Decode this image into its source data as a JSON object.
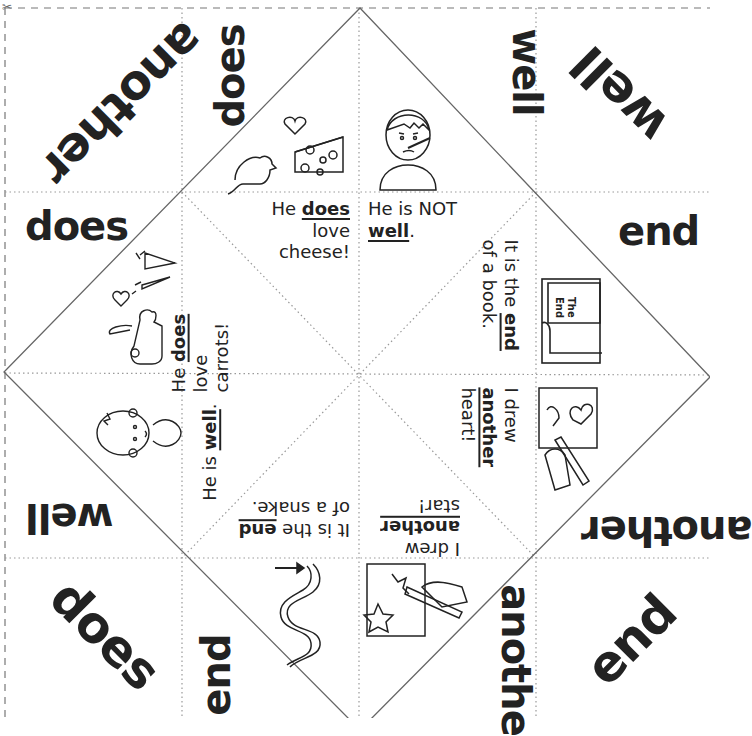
{
  "worksheet": {
    "type": "fortune teller (cootie catcher) sight words",
    "accent_color": "#222222",
    "corner_words": [
      {
        "id": "tl-big",
        "text": "another"
      },
      {
        "id": "tl-top",
        "text": "does"
      },
      {
        "id": "tl-left",
        "text": "does"
      },
      {
        "id": "tr-top",
        "text": "well"
      },
      {
        "id": "tr-big",
        "text": "well"
      },
      {
        "id": "tr-right",
        "text": "end"
      },
      {
        "id": "bl-left",
        "text": "well"
      },
      {
        "id": "bl-big",
        "text": "does"
      },
      {
        "id": "bl-bottom",
        "text": "end"
      },
      {
        "id": "br-right",
        "text": "another"
      },
      {
        "id": "br-big",
        "text": "end"
      },
      {
        "id": "br-bottom",
        "text": "anothe"
      }
    ],
    "flaps": [
      {
        "id": "mouse-cheese",
        "pre": "He ",
        "word": "does",
        "post1": "love",
        "post2": "cheese!",
        "icon": "mouse-cheese-heart-icon"
      },
      {
        "id": "sick-boy",
        "pre": "He is NOT",
        "word": "well",
        "post1": ".",
        "icon": "sick-boy-thermometer-icon"
      },
      {
        "id": "rabbit-carrots",
        "pre": "He ",
        "word": "does",
        "post1": "love",
        "post2": "carrots!",
        "icon": "rabbit-carrots-heart-icon"
      },
      {
        "id": "book-end",
        "pre": "It is the ",
        "word": "end",
        "post1": "of a book.",
        "icon": "book-the-end-icon",
        "book_text_1": "The",
        "book_text_2": "End"
      },
      {
        "id": "happy-boy",
        "pre": "He is ",
        "word": "well",
        "post1": ".",
        "icon": "happy-boy-icon"
      },
      {
        "id": "heart-drawing",
        "pre": "I drew",
        "word": "another",
        "post1": "heart!",
        "icon": "hand-drawing-hearts-icon"
      },
      {
        "id": "snake-end",
        "pre": "It is the ",
        "word": "end",
        "post1": "of a snake.",
        "icon": "snake-arrow-icon"
      },
      {
        "id": "star-drawing",
        "pre": "I drew",
        "word": "another",
        "post1": "star!",
        "icon": "hand-drawing-stars-icon"
      }
    ],
    "scissors_icon": "✂"
  }
}
